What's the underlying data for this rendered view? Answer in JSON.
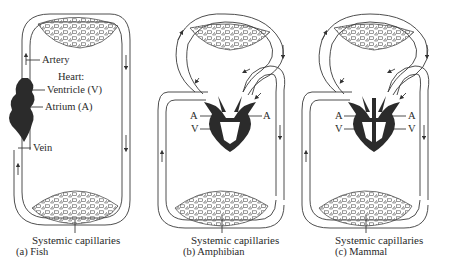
{
  "panels": [
    {
      "id": "fish",
      "caption": "(a) Fish",
      "capillaries_label": "Systemic capillaries",
      "labels": {
        "artery": "Artery",
        "heart": "Heart:",
        "ventricle": "Ventricle (V)",
        "atrium": "Atrium (A)",
        "vein": "Vein"
      }
    },
    {
      "id": "amphibian",
      "caption": "(b) Amphibian",
      "capillaries_label": "Systemic capillaries",
      "labels": {
        "atrium_left": "A",
        "atrium_right": "A",
        "ventricle": "V"
      }
    },
    {
      "id": "mammal",
      "caption": "(c) Mammal",
      "capillaries_label": "Systemic capillaries",
      "labels": {
        "atrium_left": "A",
        "atrium_right": "A",
        "ventricle_left": "V",
        "ventricle_right": "V"
      }
    }
  ],
  "colors": {
    "line": "#3a3a3a",
    "heart": "#2b2b2b",
    "background": "#ffffff"
  }
}
